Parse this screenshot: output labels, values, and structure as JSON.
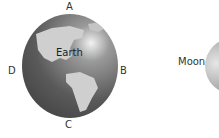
{
  "diagram": {
    "earth": {
      "label": "Earth",
      "positions": {
        "top": "A",
        "right": "B",
        "bottom": "C",
        "left": "D"
      }
    },
    "moon": {
      "label": "Moon"
    }
  }
}
